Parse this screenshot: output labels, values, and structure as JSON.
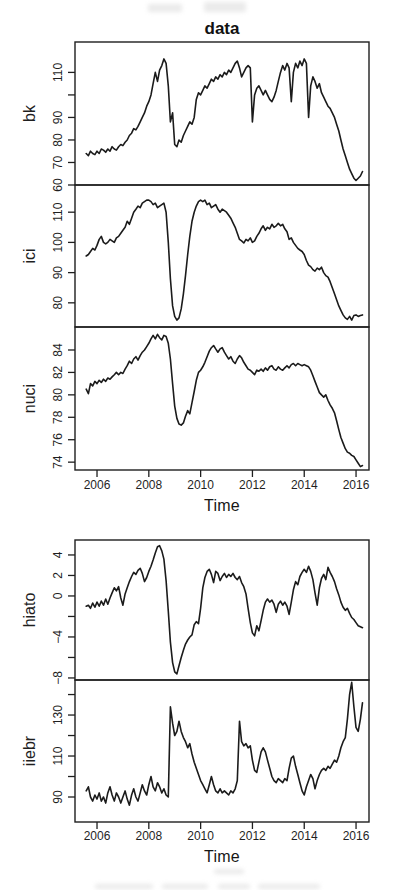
{
  "page": {
    "background": "#ffffff"
  },
  "colors": {
    "line": "#1b1b1b",
    "axis": "#1f1f1f",
    "text": "#1f1f1f"
  },
  "chart_data": [
    {
      "type": "line",
      "title": "data",
      "xlabel": "Time",
      "legend": "none",
      "grid": false,
      "xlim": [
        2005.15,
        2016.5
      ],
      "x_ticks": [
        2006,
        2008,
        2010,
        2012,
        2014,
        2016
      ],
      "x_tick_labels": [
        "2006",
        "2008",
        "2010",
        "2012",
        "2014",
        "2016"
      ],
      "x_start": 2005.5833,
      "x_step_years": 0.0833333,
      "panels": [
        {
          "ylabel": "bk",
          "ylim": [
            60,
            123.5
          ],
          "y_ticks": [
            60,
            70,
            80,
            90,
            100,
            110
          ],
          "y_tick_labels": [
            "60",
            "70",
            "80",
            "90",
            "",
            "110"
          ],
          "values": [
            74,
            73,
            75,
            74,
            73.5,
            75,
            74,
            76,
            75.5,
            74.5,
            76,
            75,
            77,
            76,
            75.5,
            77,
            78,
            77.5,
            79,
            80,
            82,
            83,
            85,
            84.5,
            86,
            88,
            90,
            92,
            95,
            97,
            100,
            105,
            110,
            106,
            111,
            113,
            116,
            114,
            104,
            88,
            92,
            78,
            77,
            80,
            79,
            82,
            84,
            86,
            88,
            87,
            90,
            98,
            101,
            100,
            102,
            104,
            103,
            105,
            107,
            106,
            108,
            107,
            109,
            108,
            110,
            109,
            111,
            110,
            112,
            114,
            115,
            112,
            108,
            110,
            112,
            113,
            112,
            88,
            100,
            103,
            104,
            102,
            100,
            102,
            100,
            98,
            97,
            99,
            102,
            106,
            110,
            113,
            111,
            114,
            112,
            97,
            110,
            114,
            112,
            115,
            113,
            116,
            114,
            90,
            104,
            108,
            106,
            103,
            105,
            101,
            99,
            97,
            95,
            94,
            92,
            90,
            87,
            84,
            80,
            76,
            73,
            70,
            67,
            65,
            63,
            62,
            63,
            64,
            66
          ]
        },
        {
          "ylabel": "ici",
          "ylim": [
            72,
            119
          ],
          "y_ticks": [
            80,
            90,
            100,
            110
          ],
          "y_tick_labels": [
            "80",
            "90",
            "100",
            "110"
          ],
          "values": [
            95.5,
            96,
            97,
            98,
            97.5,
            99,
            101,
            102,
            100,
            99.5,
            100,
            101,
            100.5,
            100,
            101.5,
            102,
            103,
            104,
            105,
            107,
            106,
            108,
            110,
            111,
            112,
            111.5,
            113,
            113.5,
            114,
            114,
            113.5,
            112.5,
            113,
            111.5,
            112,
            112.5,
            113,
            110,
            100,
            88,
            79,
            75.5,
            74.3,
            75,
            78,
            83,
            89,
            96,
            102,
            107,
            110,
            112,
            113.5,
            114,
            113.5,
            114,
            112.5,
            113,
            111.5,
            112,
            112.5,
            111,
            110,
            111,
            110.5,
            110,
            109,
            108,
            106.5,
            105,
            103,
            101,
            100.5,
            99.8,
            101,
            100.5,
            101.5,
            100,
            100.5,
            102,
            103,
            104.5,
            105.5,
            104,
            105,
            104.5,
            106,
            105,
            105.5,
            106.3,
            105.5,
            106,
            104.5,
            103.5,
            101,
            101.5,
            100,
            99,
            98,
            97.5,
            97,
            96,
            94,
            92.5,
            92,
            91,
            90.5,
            91.5,
            91,
            91.8,
            90,
            89,
            88.5,
            87,
            85,
            83,
            81,
            79,
            77.5,
            76,
            75,
            74.5,
            75.5,
            74.3,
            75.8,
            76,
            75.5,
            75.8,
            76
          ]
        },
        {
          "ylabel": "nuci",
          "ylim": [
            73.3,
            86.05
          ],
          "y_ticks": [
            74,
            76,
            78,
            80,
            82,
            84
          ],
          "y_tick_labels": [
            "74",
            "76",
            "78",
            "80",
            "82",
            "84"
          ],
          "values": [
            80.5,
            80.1,
            81,
            80.8,
            81.2,
            81,
            81.3,
            81.1,
            81.4,
            81.2,
            81.5,
            81.4,
            81.6,
            81.8,
            82,
            81.8,
            82,
            81.9,
            82.3,
            82.6,
            83,
            82.8,
            83.2,
            83.4,
            83.1,
            83.5,
            83.8,
            84,
            84.3,
            84.6,
            85,
            85.3,
            85,
            85.4,
            85.1,
            84.9,
            85.3,
            85.2,
            84.6,
            83.2,
            81,
            79,
            77.9,
            77.4,
            77.3,
            77.5,
            78.1,
            78.6,
            78.3,
            79.3,
            80.3,
            81.3,
            82,
            82.2,
            82.5,
            82.9,
            83.4,
            83.9,
            84.2,
            84.4,
            84.1,
            83.8,
            84.1,
            84.2,
            83.8,
            83.5,
            83.2,
            83.4,
            83,
            82.8,
            83.2,
            83.5,
            83.3,
            82.9,
            82.6,
            82.3,
            82.2,
            82,
            81.8,
            82.2,
            82.1,
            82.3,
            82.1,
            82.4,
            82.2,
            82.5,
            82.6,
            82.3,
            82.2,
            82.5,
            82.3,
            82.2,
            82.4,
            82.6,
            82.4,
            82.7,
            82.8,
            82.6,
            82.8,
            82.7,
            82.6,
            82.7,
            82.6,
            82.5,
            82.2,
            81.7,
            81.2,
            80.7,
            80.2,
            80,
            79.8,
            80,
            79.5,
            79.1,
            78.8,
            78.4,
            77.7,
            76.9,
            76.2,
            75.7,
            75.2,
            74.9,
            74.8,
            74.6,
            74.5,
            74.2,
            73.9,
            73.6,
            73.7
          ]
        }
      ]
    },
    {
      "type": "line",
      "title": "",
      "xlabel": "Time",
      "legend": "none",
      "grid": false,
      "xlim": [
        2005.15,
        2016.5
      ],
      "x_ticks": [
        2006,
        2008,
        2010,
        2012,
        2014,
        2016
      ],
      "x_tick_labels": [
        "2006",
        "2008",
        "2010",
        "2012",
        "2014",
        "2016"
      ],
      "x_start": 2005.5833,
      "x_step_years": 0.0833333,
      "panels": [
        {
          "ylabel": "hiato",
          "ylim": [
            -8.2,
            5.46
          ],
          "y_ticks": [
            -8,
            -6,
            -4,
            -2,
            0,
            2,
            4
          ],
          "y_tick_labels": [
            "−8",
            "",
            "−4",
            "",
            "0",
            "2",
            "4"
          ],
          "values": [
            -1,
            -0.9,
            -1.2,
            -0.7,
            -1.1,
            -0.6,
            -1,
            -0.5,
            -0.9,
            -0.3,
            -0.8,
            -0.2,
            0.3,
            0.8,
            0.5,
            0.9,
            -0.2,
            -0.9,
            0.2,
            0.8,
            1.4,
            1.9,
            2.3,
            2.1,
            2.5,
            2.7,
            2.2,
            1.4,
            1.8,
            2.4,
            2.9,
            3.5,
            4.2,
            4.8,
            4.9,
            4.4,
            3.6,
            1.5,
            -1.5,
            -4.5,
            -6.5,
            -7.4,
            -7.6,
            -6.8,
            -6,
            -5.3,
            -4.7,
            -4.3,
            -4,
            -3.8,
            -2.8,
            -2.5,
            -2.7,
            -1.2,
            0.8,
            1.8,
            2.4,
            2.6,
            2.1,
            1.3,
            2.4,
            2.2,
            1.5,
            1.9,
            2.2,
            1.8,
            2.1,
            1.9,
            2.2,
            1.8,
            1.6,
            1.9,
            1.3,
            0.9,
            0.2,
            -1.2,
            -2.6,
            -3.6,
            -3.9,
            -2.9,
            -3.4,
            -2.4,
            -1.4,
            -0.6,
            -0.3,
            -0.6,
            -0.4,
            -0.8,
            -1.6,
            -0.8,
            -0.5,
            -0.9,
            -0.6,
            -1,
            -1.8,
            -0.6,
            0.6,
            1.4,
            1.1,
            1.9,
            2.3,
            2.6,
            2.3,
            2.9,
            2.4,
            1.6,
            0.3,
            -0.9,
            0.8,
            1.7,
            2.1,
            1.6,
            2.8,
            2.3,
            1.9,
            1.4,
            0.7,
            0.1,
            -0.6,
            -1.1,
            -1.4,
            -1.2,
            -1.7,
            -2.1,
            -2.3,
            -2.6,
            -2.9,
            -3,
            -3.1
          ]
        },
        {
          "ylabel": "iiebr",
          "ylim": [
            77.8,
            147.1
          ],
          "y_ticks": [
            90,
            100,
            110,
            120,
            130,
            140
          ],
          "y_tick_labels": [
            "90",
            "",
            "110",
            "",
            "130",
            ""
          ],
          "values": [
            93,
            95,
            90,
            88,
            91,
            89,
            92,
            88,
            90,
            87,
            92,
            95,
            91,
            88,
            92,
            90,
            87,
            90,
            93,
            89,
            86,
            91,
            94,
            90,
            88,
            92,
            96,
            93,
            91,
            96,
            100,
            95,
            93,
            97,
            95,
            92,
            94,
            91,
            90,
            134,
            126,
            120,
            122,
            127,
            122,
            119,
            117,
            114,
            116,
            111,
            107,
            104,
            101,
            98,
            96,
            94,
            92,
            96,
            100,
            96,
            93,
            92,
            94,
            92,
            93,
            92,
            91,
            93,
            92,
            94,
            98,
            127,
            117,
            115,
            116,
            114,
            115,
            108,
            103,
            102,
            107,
            112,
            114,
            112,
            108,
            104,
            100,
            98,
            97,
            99,
            98,
            97,
            99,
            98,
            104,
            109,
            110,
            105,
            101,
            97,
            93,
            91,
            95,
            98,
            101,
            99,
            94,
            98,
            101,
            103,
            104,
            103,
            105,
            104,
            106,
            108,
            107,
            110,
            114,
            117,
            119,
            128,
            140,
            146,
            134,
            124,
            122,
            128,
            136
          ]
        }
      ]
    }
  ]
}
